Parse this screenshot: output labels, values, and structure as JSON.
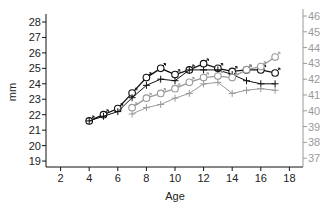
{
  "chart_data": {
    "type": "line",
    "title": "",
    "xlabel": "Age",
    "ylabel": "mm",
    "y2label": "",
    "xlim": [
      1,
      18.5
    ],
    "ylim": [
      18.5,
      28.5
    ],
    "y2lim": [
      36.5,
      46.5
    ],
    "x_ticks": [
      2,
      4,
      6,
      8,
      10,
      12,
      14,
      16,
      18
    ],
    "y_ticks": [
      19,
      20,
      21,
      22,
      23,
      24,
      25,
      26,
      27,
      28
    ],
    "y2_ticks": [
      37,
      38,
      39,
      40,
      41,
      42,
      43,
      44,
      45,
      46
    ],
    "grid": false,
    "legend": "none",
    "colors": {
      "primary": "#111111",
      "secondary": "#9a9a9a"
    },
    "series": [
      {
        "name": "Male (left axis)",
        "axis": "left",
        "marker": "male-symbol",
        "color": "#111111",
        "x": [
          4,
          5,
          6,
          7,
          8,
          9,
          10,
          11,
          12,
          13,
          14,
          15,
          16,
          17
        ],
        "values": [
          21.6,
          22.0,
          22.4,
          23.4,
          24.4,
          25.0,
          24.6,
          24.9,
          25.3,
          25.0,
          24.8,
          24.9,
          24.9,
          24.7
        ]
      },
      {
        "name": "Cross (left axis)",
        "axis": "left",
        "marker": "plus",
        "color": "#111111",
        "x": [
          4,
          5,
          6,
          7,
          8,
          9,
          10,
          11,
          12,
          13,
          14,
          15,
          16,
          17
        ],
        "values": [
          21.6,
          21.9,
          22.2,
          23.1,
          23.9,
          24.3,
          24.2,
          24.9,
          24.9,
          24.9,
          24.6,
          24.2,
          24.0,
          24.0
        ]
      },
      {
        "name": "Male (right axis)",
        "axis": "right",
        "marker": "male-symbol",
        "color": "#9a9a9a",
        "x": [
          7,
          8,
          9,
          10,
          11,
          12,
          13,
          14,
          15,
          16,
          17
        ],
        "values": [
          40.2,
          40.8,
          41.1,
          41.4,
          41.8,
          42.1,
          42.2,
          42.1,
          42.6,
          42.8,
          43.4
        ]
      },
      {
        "name": "Cross (right axis)",
        "axis": "right",
        "marker": "plus",
        "color": "#9a9a9a",
        "x": [
          7,
          8,
          9,
          10,
          11,
          12,
          13,
          14,
          15,
          16,
          17
        ],
        "values": [
          39.8,
          40.2,
          40.4,
          40.8,
          41.1,
          41.7,
          41.8,
          41.1,
          41.3,
          41.4,
          41.3
        ]
      }
    ]
  }
}
